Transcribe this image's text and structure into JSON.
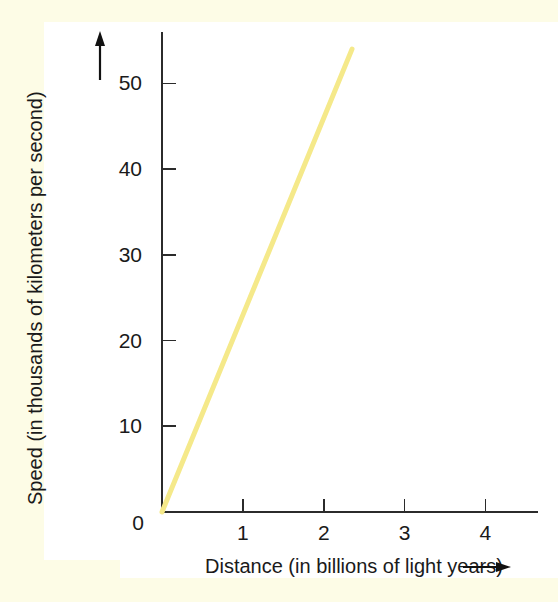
{
  "figure": {
    "background_color": "#ffffff",
    "paper_margin_color": "#fdfce6"
  },
  "chart_data": {
    "type": "line",
    "title": "",
    "subtitle": "",
    "xlabel": "Distance (in billions of light years)",
    "ylabel": "Speed (in thousands of kilometers per second)",
    "xlabel_arrow": "→",
    "ylabel_arrow": "↑",
    "xlim": [
      0,
      4.65
    ],
    "ylim": [
      0,
      56
    ],
    "grid": false,
    "legend": null,
    "legend_position": "none",
    "x_ticks": [
      0,
      1,
      2,
      3,
      4
    ],
    "x_tick_labels": [
      "0",
      "1",
      "2",
      "3",
      "4"
    ],
    "y_ticks": [
      0,
      10,
      20,
      30,
      40,
      50
    ],
    "y_tick_labels": [
      "0",
      "10",
      "20",
      "30",
      "40",
      "50"
    ],
    "series": [
      {
        "name": "Hubble relation",
        "color": "#f5e98a",
        "line_width": 5,
        "x": [
          0,
          2.35
        ],
        "y": [
          0,
          54
        ],
        "slope": 23,
        "intercept": 0
      }
    ],
    "annotations": []
  },
  "axis_labels": {
    "y_axis_text": "Speed (in thousands of kilometers per second)",
    "x_axis_text": "Distance (in billions of light years)"
  }
}
